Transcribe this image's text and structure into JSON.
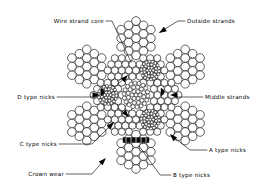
{
  "figure": {
    "type": "technical-cross-section-diagram",
    "background_color": "#ffffff",
    "line_color": "#000000",
    "width": 268,
    "height": 188
  },
  "labels": [
    {
      "id": "wire-strand-core",
      "text": "Wire strand core",
      "align": "end",
      "x": 104,
      "y": 23,
      "has_arrow": false
    },
    {
      "id": "outside-strands",
      "text": "Outside strands",
      "align": "start",
      "x": 187,
      "y": 23,
      "has_arrow": true
    },
    {
      "id": "d-type-nicks",
      "text": "D type nicks",
      "align": "end",
      "x": 55,
      "y": 99,
      "has_arrow": true
    },
    {
      "id": "middle-strands",
      "text": "Middle strands",
      "align": "start",
      "x": 205,
      "y": 99,
      "has_arrow": true
    },
    {
      "id": "c-type-nicks",
      "text": "C type nicks",
      "align": "end",
      "x": 57,
      "y": 146,
      "has_arrow": true
    },
    {
      "id": "a-type-nicks",
      "text": "A type nicks",
      "align": "start",
      "x": 209,
      "y": 152,
      "has_arrow": true
    },
    {
      "id": "crown-wear",
      "text": "Crown wear",
      "align": "end",
      "x": 64,
      "y": 176,
      "has_arrow": true
    },
    {
      "id": "b-type-nicks",
      "text": "B type nicks",
      "align": "start",
      "x": 173,
      "y": 177,
      "has_arrow": false
    }
  ],
  "rope": {
    "center_x": 136,
    "center_y": 95,
    "outer_radius": 74,
    "wire_radius": 4.3,
    "core_wire_radius": 2.0,
    "outer_strand_count": 6,
    "middle_strand_count": 6,
    "core_strand_count": 1,
    "wires_per_strand": 19
  },
  "nick_markers": [
    {
      "id": "b-nick-band",
      "x": 136,
      "y": 140,
      "w": 26,
      "h": 5,
      "kind": "band"
    },
    {
      "id": "d-nick-wedge",
      "x": 106,
      "y": 92,
      "kind": "wedge"
    },
    {
      "id": "a-nick-wedge",
      "x": 166,
      "y": 92,
      "kind": "wedge"
    }
  ]
}
